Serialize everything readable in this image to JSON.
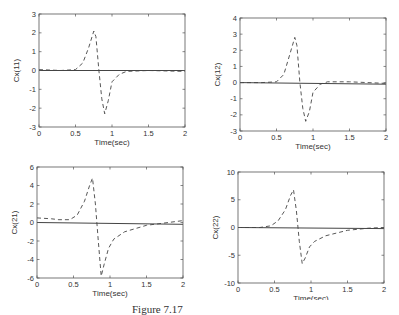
{
  "caption": "Figure 7.17",
  "chart_data": [
    {
      "type": "line",
      "id": "cx11",
      "title": "",
      "xlabel": "Time(sec)",
      "ylabel": "Cx(11)",
      "xlim": [
        0,
        2
      ],
      "ylim": [
        -3,
        3
      ],
      "xticks": [
        0,
        0.5,
        1,
        1.5,
        2
      ],
      "xtick_labels": [
        "0",
        "0.5",
        "1",
        "1.5",
        "2"
      ],
      "yticks": [
        -3,
        -2,
        -1,
        0,
        1,
        2,
        3
      ],
      "ytick_labels": [
        "-3",
        "-2",
        "-1",
        "0",
        "1",
        "2",
        "3"
      ],
      "grid": false,
      "frame_px": {
        "left": 39,
        "top": 14,
        "right": 185,
        "bottom": 127
      },
      "series": [
        {
          "name": "solid",
          "style": "solid",
          "x": [
            0,
            2
          ],
          "y": [
            0,
            0
          ]
        },
        {
          "name": "dashed",
          "style": "dashed",
          "x": [
            0,
            0.3,
            0.5,
            0.6,
            0.68,
            0.75,
            0.78,
            0.82,
            0.86,
            0.9,
            0.95,
            1.0,
            1.1,
            1.2,
            1.5,
            2.0
          ],
          "y": [
            0.05,
            0.0,
            0.05,
            0.4,
            1.2,
            2.1,
            1.8,
            0.0,
            -1.5,
            -2.3,
            -1.6,
            -0.6,
            -0.2,
            -0.05,
            0.0,
            -0.05
          ]
        }
      ]
    },
    {
      "type": "line",
      "id": "cx12",
      "title": "",
      "xlabel": "Time(sec)",
      "ylabel": "Cx(12)",
      "xlim": [
        0,
        2
      ],
      "ylim": [
        -3,
        4
      ],
      "xticks": [
        0,
        0.5,
        1,
        1.5,
        2
      ],
      "xtick_labels": [
        "0",
        "0.5",
        "1",
        "1.5",
        "2"
      ],
      "yticks": [
        -3,
        -2,
        -1,
        0,
        1,
        2,
        3,
        4
      ],
      "ytick_labels": [
        "-3",
        "-2",
        "-1",
        "0",
        "1",
        "2",
        "3",
        "4"
      ],
      "grid": false,
      "frame_px": {
        "left": 240,
        "top": 18,
        "right": 386,
        "bottom": 131
      },
      "series": [
        {
          "name": "solid",
          "style": "solid",
          "x": [
            0,
            2
          ],
          "y": [
            0,
            -0.1
          ]
        },
        {
          "name": "dashed",
          "style": "dashed",
          "x": [
            0,
            0.3,
            0.5,
            0.6,
            0.68,
            0.75,
            0.78,
            0.82,
            0.86,
            0.9,
            0.95,
            1.0,
            1.1,
            1.2,
            1.5,
            2.0
          ],
          "y": [
            0.0,
            0.0,
            0.05,
            0.5,
            1.7,
            2.8,
            2.3,
            0.0,
            -1.6,
            -2.4,
            -1.8,
            -0.6,
            -0.1,
            0.05,
            0.05,
            -0.05
          ]
        }
      ]
    },
    {
      "type": "line",
      "id": "cx21",
      "title": "",
      "xlabel": "Time(sec)",
      "ylabel": "Cx(21)",
      "xlim": [
        0,
        2
      ],
      "ylim": [
        -6,
        6
      ],
      "xticks": [
        0,
        0.5,
        1,
        1.5,
        2
      ],
      "xtick_labels": [
        "0",
        "0.5",
        "1",
        "1.5",
        "2"
      ],
      "yticks": [
        -6,
        -4,
        -2,
        0,
        2,
        4,
        6
      ],
      "ytick_labels": [
        "-6",
        "-4",
        "-2",
        "0",
        "2",
        "4",
        "6"
      ],
      "grid": false,
      "frame_px": {
        "left": 37,
        "top": 167,
        "right": 183,
        "bottom": 278
      },
      "series": [
        {
          "name": "solid",
          "style": "solid",
          "x": [
            0,
            2
          ],
          "y": [
            0,
            -0.2
          ]
        },
        {
          "name": "dashed",
          "style": "dashed",
          "x": [
            0,
            0.2,
            0.3,
            0.45,
            0.55,
            0.65,
            0.72,
            0.76,
            0.8,
            0.84,
            0.88,
            0.92,
            0.98,
            1.05,
            1.2,
            1.5,
            1.8,
            2.0
          ],
          "y": [
            0.5,
            0.4,
            0.3,
            0.3,
            0.8,
            2.3,
            4.0,
            4.8,
            2.0,
            -2.0,
            -5.8,
            -4.5,
            -2.8,
            -1.8,
            -1.0,
            -0.3,
            0.0,
            0.2
          ]
        }
      ]
    },
    {
      "type": "line",
      "id": "cx22",
      "title": "",
      "xlabel": "Time(sec)",
      "ylabel": "Cx(22)",
      "xlim": [
        0,
        2
      ],
      "ylim": [
        -10,
        10
      ],
      "xticks": [
        0,
        0.5,
        1,
        1.5,
        2
      ],
      "xtick_labels": [
        "0",
        "0.5",
        "1",
        "1.5",
        "2"
      ],
      "yticks": [
        -10,
        -5,
        0,
        5,
        10
      ],
      "ytick_labels": [
        "-10",
        "-5",
        "0",
        "5",
        "10"
      ],
      "grid": false,
      "frame_px": {
        "left": 238,
        "top": 172,
        "right": 384,
        "bottom": 283
      },
      "series": [
        {
          "name": "solid",
          "style": "solid",
          "x": [
            0,
            2
          ],
          "y": [
            0,
            -0.2
          ]
        },
        {
          "name": "dashed",
          "style": "dashed",
          "x": [
            0,
            0.3,
            0.45,
            0.55,
            0.65,
            0.72,
            0.76,
            0.8,
            0.84,
            0.88,
            0.92,
            0.98,
            1.05,
            1.2,
            1.5,
            1.8,
            2.0
          ],
          "y": [
            0.0,
            0.0,
            0.3,
            1.2,
            3.2,
            5.8,
            6.8,
            3.0,
            -2.5,
            -6.5,
            -5.5,
            -3.5,
            -2.5,
            -1.5,
            -0.5,
            -0.1,
            0.0
          ]
        }
      ]
    }
  ]
}
